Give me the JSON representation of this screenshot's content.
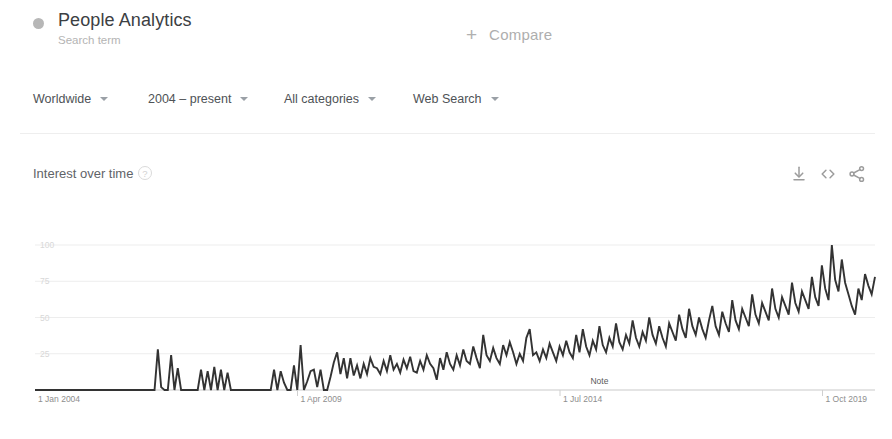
{
  "header": {
    "term_title": "People Analytics",
    "term_subtitle": "Search term",
    "dot_icon": "series-color-dot",
    "compare_plus": "+",
    "compare_label": "Compare"
  },
  "filters": [
    {
      "label": "Worldwide",
      "name": "filter-location"
    },
    {
      "label": "2004 – present",
      "name": "filter-time-range"
    },
    {
      "label": "All categories",
      "name": "filter-category"
    },
    {
      "label": "Web Search",
      "name": "filter-search-type"
    }
  ],
  "card": {
    "title": "Interest over time",
    "help_icon": "?",
    "actions": [
      {
        "name": "download-icon",
        "label": "Download"
      },
      {
        "name": "embed-code-icon",
        "label": "Embed"
      },
      {
        "name": "share-icon",
        "label": "Share"
      }
    ]
  },
  "chart_data": {
    "type": "line",
    "title": "Interest over time",
    "xlabel": "",
    "ylabel": "",
    "ylim": [
      0,
      100
    ],
    "yticks": [
      100,
      75,
      50,
      25
    ],
    "ytick_labels": [
      "100",
      "75",
      "50",
      "25"
    ],
    "grid": true,
    "legend": "none",
    "line_color": "#333333",
    "xtick_labels": [
      "1 Jan 2004",
      "1 Apr 2009",
      "1 Jul 2014",
      "1 Oct 2019"
    ],
    "xtick_positions": [
      0,
      0.3125,
      0.625,
      0.9375
    ],
    "annotations": [
      {
        "text": "Note",
        "x": 0.672,
        "y": 0
      }
    ],
    "x_start": "2004-01",
    "x_end": "2022-10",
    "x_interval": "monthly",
    "values": [
      0,
      0,
      0,
      0,
      0,
      0,
      0,
      0,
      0,
      0,
      0,
      0,
      0,
      0,
      0,
      0,
      0,
      0,
      0,
      0,
      0,
      0,
      0,
      0,
      0,
      0,
      0,
      0,
      0,
      0,
      0,
      0,
      0,
      0,
      0,
      0,
      0,
      28,
      2,
      0,
      0,
      24,
      0,
      15,
      0,
      0,
      0,
      0,
      0,
      0,
      14,
      0,
      13,
      0,
      16,
      0,
      14,
      0,
      12,
      0,
      0,
      0,
      0,
      0,
      0,
      0,
      0,
      0,
      0,
      0,
      0,
      0,
      14,
      0,
      13,
      5,
      0,
      0,
      17,
      0,
      31,
      0,
      6,
      13,
      14,
      2,
      14,
      0,
      0,
      9,
      19,
      26,
      11,
      22,
      8,
      22,
      10,
      17,
      8,
      18,
      11,
      22,
      16,
      15,
      11,
      20,
      13,
      24,
      14,
      18,
      12,
      21,
      15,
      23,
      13,
      12,
      20,
      14,
      24,
      18,
      15,
      7,
      22,
      14,
      26,
      18,
      14,
      24,
      17,
      28,
      20,
      18,
      30,
      22,
      15,
      38,
      24,
      20,
      29,
      22,
      18,
      31,
      24,
      33,
      26,
      18,
      25,
      20,
      36,
      42,
      24,
      26,
      20,
      28,
      22,
      32,
      26,
      20,
      30,
      24,
      34,
      26,
      22,
      38,
      26,
      42,
      30,
      24,
      34,
      28,
      44,
      31,
      26,
      36,
      30,
      46,
      33,
      28,
      38,
      32,
      48,
      36,
      30,
      40,
      34,
      50,
      38,
      32,
      44,
      36,
      30,
      46,
      40,
      34,
      52,
      42,
      36,
      56,
      44,
      38,
      50,
      42,
      36,
      48,
      58,
      44,
      38,
      54,
      46,
      40,
      62,
      48,
      42,
      56,
      50,
      44,
      66,
      52,
      46,
      60,
      54,
      48,
      70,
      56,
      50,
      64,
      58,
      52,
      74,
      60,
      54,
      68,
      62,
      56,
      78,
      64,
      58,
      86,
      70,
      62,
      100,
      76,
      68,
      90,
      74,
      66,
      58,
      52,
      70,
      62,
      80,
      72,
      66,
      78
    ]
  }
}
